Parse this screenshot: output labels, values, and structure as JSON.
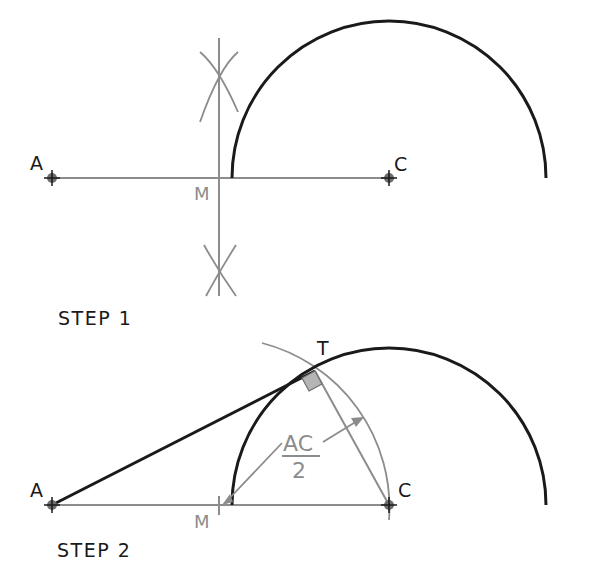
{
  "colors": {
    "heavy": "#1a1a1a",
    "light": "#8c8c8c",
    "point": "#6e6e6e"
  },
  "step1": {
    "caption": "STEP 1",
    "labels": {
      "a": "A",
      "c": "C",
      "m": "M"
    }
  },
  "step2": {
    "caption": "STEP 2",
    "labels": {
      "a": "A",
      "c": "C",
      "m": "M",
      "t": "T",
      "frac_num": "AC",
      "frac_den": "2"
    }
  }
}
